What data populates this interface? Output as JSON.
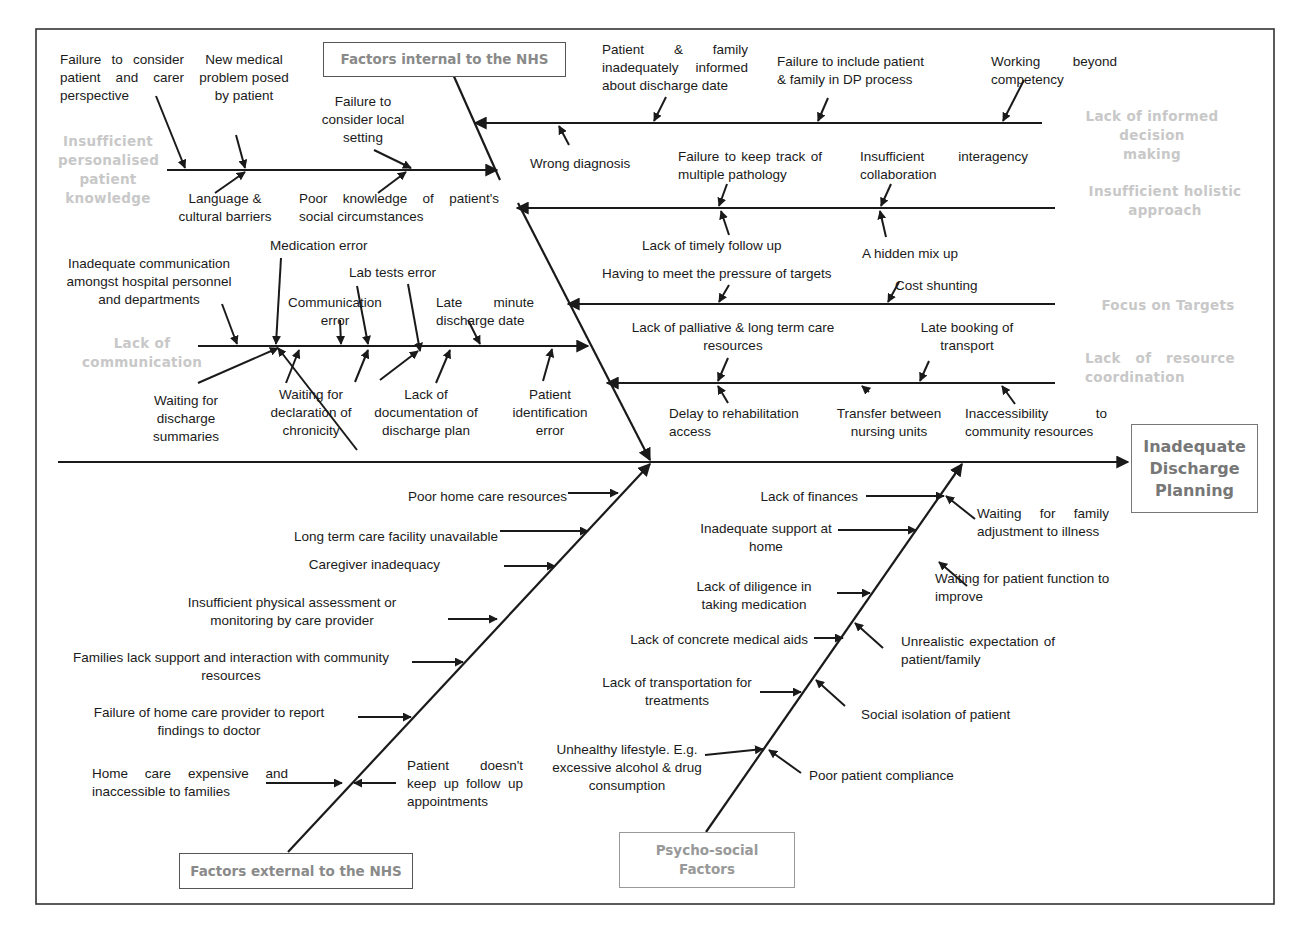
{
  "diagram": {
    "type": "fishbone",
    "effect": "Inadequate Discharge Planning",
    "effect_lines": [
      "Inadequate",
      "Discharge",
      "Planning"
    ],
    "colors": {
      "line": "#1a1a1a",
      "category_text": "#c8c8c8",
      "box_text": "#8a8a8a",
      "border": "#555555"
    }
  },
  "major_groups": {
    "internal": {
      "label": "Factors internal to the NHS"
    },
    "external": {
      "label": "Factors external to the NHS"
    },
    "psychosocial": {
      "label": "Psycho-social Factors",
      "lines": [
        "Psycho-social",
        "Factors"
      ]
    }
  },
  "categories": {
    "personalised": {
      "label": "Insufficient personalised patient knowledge",
      "lines": [
        "Insufficient",
        "personalised",
        "patient",
        "knowledge"
      ]
    },
    "communication": {
      "label": "Lack of communication",
      "lines": [
        "Lack of",
        "communication"
      ]
    },
    "informed": {
      "label": "Lack of informed decision making",
      "lines": [
        "Lack of informed decision",
        "making"
      ]
    },
    "holistic": {
      "label": "Insufficient holistic approach",
      "lines": [
        "Insufficient holistic",
        "approach"
      ]
    },
    "targets": {
      "label": "Focus on Targets"
    },
    "resource": {
      "label": "Lack of resource coordination",
      "lines": [
        "Lack of resource",
        "coordination"
      ]
    }
  },
  "causes": {
    "personalised": [
      "Failure to consider patient and carer perspective",
      "New medical problem posed by patient",
      "Failure to consider local setting",
      "Language & cultural barriers",
      "Poor knowledge of patient's social circumstances"
    ],
    "communication": [
      "Inadequate communication amongst hospital personnel and departments",
      "Medication error",
      "Communication error",
      "Lab tests error",
      "Late minute discharge date",
      "Waiting for discharge summaries",
      "Waiting for declaration of chronicity",
      "Lack of documentation of discharge plan",
      "Patient identification error"
    ],
    "informed": [
      "Patient & family inadequately informed about discharge date",
      "Failure to include patient & family in DP process",
      "Working beyond competency",
      "Wrong diagnosis"
    ],
    "holistic": [
      "Failure to keep track of multiple pathology",
      "Insufficient interagency collaboration",
      "Lack of timely follow up",
      "A hidden mix up"
    ],
    "targets": [
      "Having to meet the pressure of targets",
      "Cost shunting"
    ],
    "resource": [
      "Lack of palliative & long term care resources",
      "Late booking of transport",
      "Delay to rehabilitation access",
      "Transfer between nursing units",
      "Inaccessibility to community resources"
    ],
    "external": [
      "Poor home care resources",
      "Long term care facility unavailable",
      "Caregiver inadequacy",
      "Insufficient physical assessment or monitoring by care provider",
      "Families lack support and interaction with community resources",
      "Failure of home care provider to report findings to doctor",
      "Home care expensive and inaccessible to families",
      "Patient doesn't keep up follow up appointments"
    ],
    "psychosocial": [
      "Lack of finances",
      "Inadequate support at home",
      "Lack of diligence in taking medication",
      "Lack of concrete medical aids",
      "Lack of transportation for treatments",
      "Unhealthy lifestyle. E.g. excessive alcohol & drug consumption",
      "Waiting for family adjustment to illness",
      "Waiting for patient function to improve",
      "Unrealistic expectation of patient/family",
      "Social isolation of patient",
      "Poor patient compliance"
    ]
  }
}
